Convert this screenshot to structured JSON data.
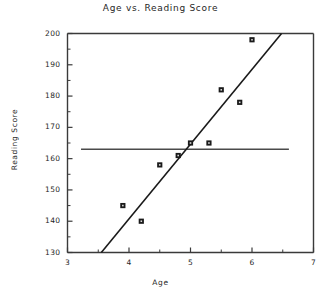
{
  "chart_data": {
    "type": "scatter",
    "title": "Age vs. Reading Score",
    "xlabel": "Age",
    "ylabel": "Reading Score",
    "xlim": [
      3,
      7
    ],
    "ylim": [
      130,
      200
    ],
    "grid": false,
    "legend": "none",
    "x_ticks": [
      3,
      4,
      5,
      6,
      7
    ],
    "x_tick_labels": [
      "3",
      "4",
      "5",
      "6",
      "7"
    ],
    "x_minor_ticks": [
      3.5,
      4.5,
      5.5,
      6.5
    ],
    "y_ticks": [
      130,
      140,
      150,
      160,
      170,
      180,
      190,
      200
    ],
    "y_tick_labels": [
      "130",
      "140",
      "150",
      "160",
      "170",
      "180",
      "190",
      "200"
    ],
    "y_minor_ticks": [
      135,
      145,
      155,
      165,
      175,
      185,
      195
    ],
    "points": [
      {
        "x": 3.9,
        "y": 145
      },
      {
        "x": 4.2,
        "y": 140
      },
      {
        "x": 4.5,
        "y": 158
      },
      {
        "x": 4.8,
        "y": 161
      },
      {
        "x": 5.0,
        "y": 165
      },
      {
        "x": 5.3,
        "y": 165
      },
      {
        "x": 5.5,
        "y": 182
      },
      {
        "x": 5.8,
        "y": 178
      },
      {
        "x": 6.0,
        "y": 198
      }
    ],
    "trend_line": {
      "x_start": 3.55,
      "y_start": 130,
      "x_end": 6.48,
      "y_end": 200
    },
    "mean_line": {
      "y": 163,
      "x_start": 3.22,
      "x_end": 6.6
    },
    "marker_style": "filled-square",
    "marker_color": "#1a1a1a",
    "line_color": "#1a1a1a",
    "mean_line_color": "#4a4a4a",
    "axis_color": "#3a3a3a",
    "background_color": "#ffffff"
  }
}
